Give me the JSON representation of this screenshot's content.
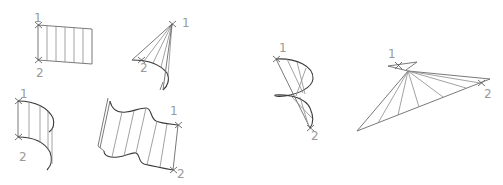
{
  "diagram": {
    "kind": "ruled-surfaces",
    "line_color": "#6a6a6a",
    "label_color": "#9a9a9a",
    "figures": [
      {
        "id": "plane-strip",
        "label_start": "1",
        "label_end": "2"
      },
      {
        "id": "cone",
        "label_start": "1",
        "label_end": "2"
      },
      {
        "id": "cylinder",
        "label_start": "1",
        "label_end": "2"
      },
      {
        "id": "wavy-surface",
        "label_start": "1",
        "label_end": "2"
      },
      {
        "id": "helicoid",
        "label_start": "1",
        "label_end": "2"
      },
      {
        "id": "fan-surface",
        "label_start": "1",
        "label_end": "2"
      }
    ]
  }
}
